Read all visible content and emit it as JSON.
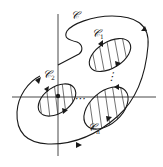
{
  "diagram": {
    "type": "contour-with-holes",
    "labels": {
      "outer": {
        "main": "𝒞",
        "sub": ""
      },
      "hole1": {
        "main": "𝒞",
        "sub": "1"
      },
      "hole2": {
        "main": "𝒞",
        "sub": "2"
      },
      "holeN": {
        "main": "𝒞",
        "sub": "n"
      }
    },
    "dots_vertical": "⋮",
    "dots_horizontal": "⋯",
    "colors": {
      "line": "#1a1a1a",
      "background": "#ffffff"
    }
  }
}
